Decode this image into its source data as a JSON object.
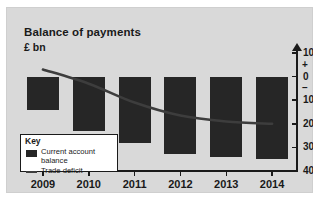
{
  "chart_data": {
    "type": "bar",
    "title": "Balance of payments",
    "subtitle": "£ bn",
    "xlabel": "",
    "ylabel": "£ bn",
    "ylim": [
      -40,
      10
    ],
    "grid": false,
    "axis_position": "right",
    "y_ticks": [
      10,
      0,
      -10,
      -20,
      -30,
      -40
    ],
    "y_tick_labels": [
      "10",
      "0",
      "10",
      "20",
      "30",
      "40"
    ],
    "y_sign_markers": [
      {
        "symbol": "+",
        "value": 5
      },
      {
        "symbol": "–",
        "value": -5
      }
    ],
    "categories": [
      "2009",
      "2010",
      "2011",
      "2012",
      "2013",
      "2014"
    ],
    "series": [
      {
        "name": "Current account balance",
        "type": "bar",
        "color": "#262626",
        "values": [
          -14,
          -23,
          -28,
          -33,
          -34,
          -35
        ]
      },
      {
        "name": "Trade deficit",
        "type": "line",
        "color": "#3d3d3d",
        "values": [
          3,
          -3,
          -11,
          -16.5,
          -19,
          -20
        ]
      }
    ],
    "legend": {
      "position": "inside-bottom-left",
      "title": "Key",
      "entries": [
        {
          "label": "Current account balance",
          "marker": "bar-swatch"
        },
        {
          "label": "Trade deficit",
          "marker": "line-swatch"
        }
      ]
    }
  },
  "figure": {
    "background": "#d9d9d9",
    "ink": "#1a1a1a"
  }
}
